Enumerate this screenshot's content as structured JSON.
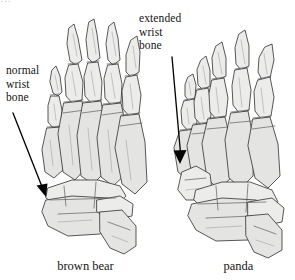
{
  "figure": {
    "background_color": "#ffffff",
    "bone_fill_color": "#ececeb",
    "outline_color": "#3a3a3a",
    "arrow_color": "#050505",
    "text_color": "#141414"
  },
  "labels": {
    "normal_wrist": "normal\nwrist\nbone",
    "extended_wrist": "extended\nwrist\nbone"
  },
  "captions": {
    "left": "brown bear",
    "right": "panda"
  },
  "annotations": [
    {
      "id": "normal-wrist-annotation",
      "label": "normal wrist bone",
      "arrow_from": [
        13,
        113
      ],
      "arrow_to": [
        46,
        196
      ],
      "points_at": "brown bear carpal bone"
    },
    {
      "id": "extended-wrist-annotation",
      "label": "extended wrist bone",
      "arrow_from": [
        172,
        57
      ],
      "arrow_to": [
        180,
        163
      ],
      "points_at": "panda radial sesamoid"
    }
  ],
  "specimens": [
    {
      "id": "brown-bear-paw",
      "name": "brown bear",
      "digits": 5,
      "wrist": "normal"
    },
    {
      "id": "panda-paw",
      "name": "panda",
      "digits": 5,
      "wrist": "extended"
    }
  ],
  "cut_text": {
    "top": "…"
  }
}
